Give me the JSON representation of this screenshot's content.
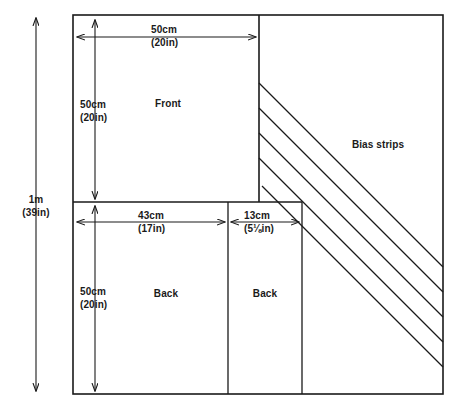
{
  "diagram": {
    "line_color": "#1a1a1a",
    "background_color": "#ffffff",
    "overall": {
      "height_label": "1m",
      "height_label_sub": "(39in)"
    },
    "regions": [
      {
        "name": "front",
        "label": "Front"
      },
      {
        "name": "back-left",
        "label": "Back"
      },
      {
        "name": "back-right",
        "label": "Back"
      },
      {
        "name": "bias-strips",
        "label": "Bias strips"
      }
    ],
    "dimensions": [
      {
        "name": "front-width",
        "value": "50cm",
        "alt": "(20in)"
      },
      {
        "name": "front-height",
        "value": "50cm",
        "alt": "(20in)"
      },
      {
        "name": "back-left-width",
        "value": "43cm",
        "alt": "(17in)"
      },
      {
        "name": "back-right-width",
        "value": "13cm",
        "alt": "(5⅛in)"
      },
      {
        "name": "back-height",
        "value": "50cm",
        "alt": "(20in)"
      }
    ],
    "bias_strip_count": 5
  }
}
